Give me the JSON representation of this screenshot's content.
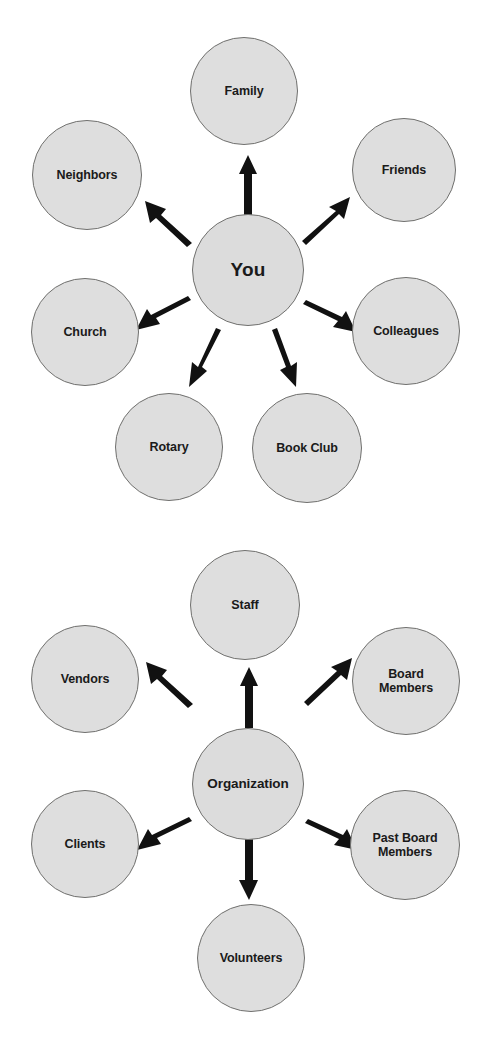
{
  "page": {
    "background_color": "#ffffff",
    "node_fill_color": "#dedede",
    "node_stroke_color": "#70706e",
    "arrow_color": "#111111",
    "text_color": "#1a1a1a"
  },
  "diagrams": [
    {
      "id": "personal-network",
      "name": "Personal Network Radial Diagram",
      "center": {
        "label": "You",
        "cx": 248,
        "cy": 270,
        "r": 56
      },
      "nodes": [
        {
          "label": "Family",
          "cx": 244,
          "cy": 91,
          "r": 54,
          "direction": "up"
        },
        {
          "label": "Friends",
          "cx": 404,
          "cy": 170,
          "r": 52,
          "direction": "up-right"
        },
        {
          "label": "Neighbors",
          "cx": 87,
          "cy": 175,
          "r": 55,
          "direction": "up-left"
        },
        {
          "label": "Colleagues",
          "cx": 406,
          "cy": 331,
          "r": 54,
          "direction": "down-right"
        },
        {
          "label": "Church",
          "cx": 85,
          "cy": 332,
          "r": 54,
          "direction": "down-left"
        },
        {
          "label": "Rotary",
          "cx": 169,
          "cy": 447,
          "r": 54,
          "direction": "down-left-steep"
        },
        {
          "label": "Book Club",
          "cx": 307,
          "cy": 448,
          "r": 55,
          "direction": "down-right-steep"
        }
      ],
      "arrows": [
        {
          "from": "You",
          "to": "Family",
          "direction": "up"
        },
        {
          "from": "You",
          "to": "Friends",
          "direction": "up-right"
        },
        {
          "from": "You",
          "to": "Neighbors",
          "direction": "up-left"
        },
        {
          "from": "You",
          "to": "Colleagues",
          "direction": "down-right"
        },
        {
          "from": "You",
          "to": "Church",
          "direction": "down-left"
        },
        {
          "from": "You",
          "to": "Rotary",
          "direction": "down-left-steep"
        },
        {
          "from": "You",
          "to": "Book Club",
          "direction": "down-right-steep"
        }
      ]
    },
    {
      "id": "organization-network",
      "name": "Organization Network Radial Diagram",
      "center": {
        "label": "Organization",
        "cx": 248,
        "cy": 783,
        "r": 55
      },
      "nodes": [
        {
          "label": "Staff",
          "cx": 245,
          "cy": 605,
          "r": 55,
          "direction": "up"
        },
        {
          "label": "Board\nMembers",
          "cx": 406,
          "cy": 681,
          "r": 54,
          "direction": "up-right"
        },
        {
          "label": "Vendors",
          "cx": 85,
          "cy": 680,
          "r": 54,
          "direction": "up-left"
        },
        {
          "label": "Past Board\nMembers",
          "cx": 405,
          "cy": 845,
          "r": 55,
          "direction": "down-right"
        },
        {
          "label": "Clients",
          "cx": 85,
          "cy": 844,
          "r": 54,
          "direction": "down-left"
        },
        {
          "label": "Volunteers",
          "cx": 251,
          "cy": 958,
          "r": 54,
          "direction": "down"
        }
      ],
      "arrows": [
        {
          "from": "Organization",
          "to": "Staff",
          "direction": "up"
        },
        {
          "from": "Organization",
          "to": "Board Members",
          "direction": "up-right"
        },
        {
          "from": "Organization",
          "to": "Vendors",
          "direction": "up-left"
        },
        {
          "from": "Organization",
          "to": "Past Board Members",
          "direction": "down-right"
        },
        {
          "from": "Organization",
          "to": "Clients",
          "direction": "down-left"
        },
        {
          "from": "Organization",
          "to": "Volunteers",
          "direction": "down"
        }
      ]
    }
  ]
}
